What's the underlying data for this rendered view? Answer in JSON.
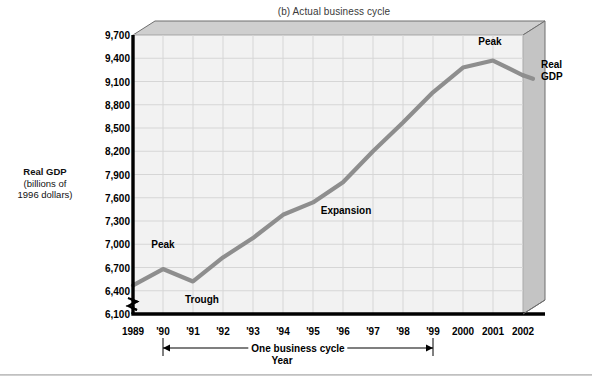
{
  "figure": {
    "title": "(b) Actual business cycle",
    "year_axis_label": "Year",
    "cycle_bracket_label": "One business cycle",
    "y_axis_title_line1": "Real GDP",
    "y_axis_title_line2": "(billions of",
    "y_axis_title_line3": "1996 dollars)",
    "line_color": "#8e8e8e",
    "plot_bg_color": "#f2f2f2",
    "frame_top_color": "#cfcfcf",
    "frame_side_color": "#c4c4c4",
    "grid_color": "#d6d6d6",
    "axis_color": "#000000"
  },
  "annotations": [
    {
      "name": "peak-1990",
      "text": "Peak",
      "x_year": 1990.0,
      "y_value": 7000,
      "align": "center"
    },
    {
      "name": "trough-1991",
      "text": "Trough",
      "x_year": 1991.3,
      "y_value": 6300,
      "align": "center"
    },
    {
      "name": "expansion",
      "text": "Expansion",
      "x_year": 1996.1,
      "y_value": 7440,
      "align": "center"
    },
    {
      "name": "peak-2001",
      "text": "Peak",
      "x_year": 2000.9,
      "y_value": 9620,
      "align": "center"
    },
    {
      "name": "series-label-real-gdp",
      "text": "Real\nGDP",
      "x_year": 2002.6,
      "y_value": 9230,
      "align": "left"
    }
  ],
  "chart_data": {
    "type": "line",
    "title": "(b) Actual business cycle",
    "xlabel": "Year",
    "ylabel": "Real GDP (billions of 1996 dollars)",
    "series_name": "Real GDP",
    "grid": true,
    "legend": "none",
    "ylim": [
      6100,
      9700
    ],
    "yticks": [
      6100,
      6400,
      6700,
      7000,
      7300,
      7600,
      7900,
      8200,
      8500,
      8800,
      9100,
      9400,
      9700
    ],
    "ytick_labels": [
      "6,100",
      "6,400",
      "6,700",
      "7,000",
      "7,300",
      "7,600",
      "7,900",
      "8,200",
      "8,500",
      "8,800",
      "9,100",
      "9,400",
      "9,700"
    ],
    "axis_break_at_origin": true,
    "xlim": [
      1989,
      2002
    ],
    "x": [
      1989,
      1990,
      1991,
      1992,
      1993,
      1994,
      1995,
      1996,
      1997,
      1998,
      1999,
      2000,
      2001,
      2002
    ],
    "xtick_labels": [
      "1989",
      "'90",
      "'91",
      "'92",
      "'93",
      "'94",
      "'95",
      "'96",
      "'97",
      "'98",
      "'99",
      "2000",
      "2001",
      "2002"
    ],
    "values": [
      6470,
      6680,
      6520,
      6830,
      7080,
      7380,
      7540,
      7800,
      8200,
      8570,
      8960,
      9280,
      9370,
      9180
    ],
    "cycle_bracket": {
      "label": "One business cycle",
      "from_year": 1990,
      "to_year": 1999
    }
  }
}
